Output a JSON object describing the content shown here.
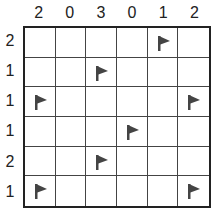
{
  "puzzle": {
    "rows": 6,
    "cols": 6,
    "column_clues": [
      "2",
      "0",
      "3",
      "0",
      "1",
      "2"
    ],
    "row_clues": [
      "2",
      "1",
      "1",
      "1",
      "2",
      "1"
    ],
    "cells": [
      [
        "",
        "",
        "",
        "",
        "flag",
        ""
      ],
      [
        "",
        "",
        "flag",
        "",
        "",
        ""
      ],
      [
        "flag",
        "",
        "",
        "",
        "",
        "flag"
      ],
      [
        "",
        "",
        "",
        "flag",
        "",
        ""
      ],
      [
        "",
        "",
        "flag",
        "",
        "",
        ""
      ],
      [
        "flag",
        "",
        "",
        "",
        "",
        "flag"
      ]
    ],
    "flag_color": "#444444",
    "line_color": "#222222"
  }
}
